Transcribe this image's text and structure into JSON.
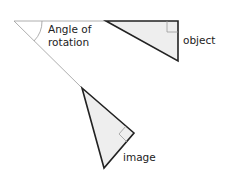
{
  "labels": {
    "angle_line1": "Angle of",
    "angle_line2": "rotation",
    "object": "object",
    "image": "image"
  },
  "colors": {
    "fill": "#eeeeee",
    "stroke": "#222222",
    "thin_line": "#888888"
  }
}
